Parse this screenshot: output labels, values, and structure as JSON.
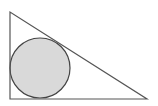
{
  "diagram": {
    "type": "geometry",
    "colors": {
      "background": "#ffffff",
      "stroke": "#555555",
      "circle_fill": "#d9d9d9",
      "circle_stroke": "#444444"
    },
    "triangle": {
      "vertices": [
        {
          "name": "top",
          "x": 10,
          "y": 12
        },
        {
          "name": "bottom-left",
          "x": 10,
          "y": 99
        },
        {
          "name": "bottom-right",
          "x": 147,
          "y": 99
        }
      ],
      "right_angle_at": "bottom-left"
    },
    "circle": {
      "cx": 40,
      "cy": 68,
      "r": 30,
      "inscribed": true
    }
  }
}
